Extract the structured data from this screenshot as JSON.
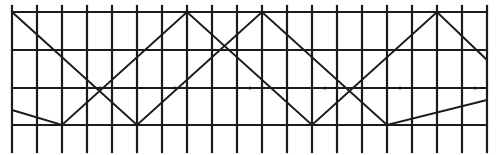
{
  "figure": {
    "kind": "line-drawing",
    "ink_color": "#1b1b1b",
    "background_color": "#ffffff",
    "width": 498,
    "height": 155,
    "line_style": "hand-inked",
    "stroke_width": 2
  },
  "chart_data": {
    "type": "line",
    "xlabel": "",
    "ylabel": "",
    "xlim": [
      0,
      498
    ],
    "ylim": [
      0,
      155
    ],
    "grid": true,
    "legend": "none",
    "panel": {
      "left": 12,
      "right": 487,
      "top": 12,
      "bottom": 125,
      "post_top_overhang": 6,
      "post_bottom_overhang": 27
    },
    "rails": {
      "name": "horizontal-rails",
      "y": [
        12,
        50,
        88,
        125
      ],
      "x_start": 12,
      "x_end": 487
    },
    "posts": {
      "name": "vertical-posts",
      "y_top": 6,
      "y_bottom": 152,
      "spacing": 25,
      "x": [
        12,
        37,
        62,
        87,
        112,
        137,
        162,
        187,
        212,
        237,
        262,
        287,
        312,
        337,
        362,
        387,
        412,
        437,
        462,
        487
      ]
    },
    "zigzag": {
      "name": "diagonal-zigzag-braces",
      "period": 150,
      "half_period": 75,
      "apex_top_y": 12,
      "apex_bottom_y": 125,
      "crossing_y": 88,
      "apex_top_x": [
        62,
        212,
        362
      ],
      "apex_bottom_x": [
        137,
        287,
        437
      ],
      "crossing_x": [
        100,
        175,
        250,
        325,
        400,
        475
      ]
    },
    "series": [
      {
        "name": "zigzag-descending-from-top-left",
        "comment": "upper zigzag: from top-left corner down to bottom rail and back up",
        "x": [
          12,
          137,
          262,
          387,
          487
        ],
        "y": [
          12,
          125,
          12,
          125,
          100
        ]
      },
      {
        "name": "zigzag-ascending-mirror",
        "comment": "mirror zigzag: from bottom-left up to top rail apexes",
        "x": [
          12,
          62,
          187,
          312,
          437,
          487
        ],
        "y": [
          110,
          125,
          12,
          125,
          12,
          60
        ]
      }
    ]
  },
  "annotations": []
}
